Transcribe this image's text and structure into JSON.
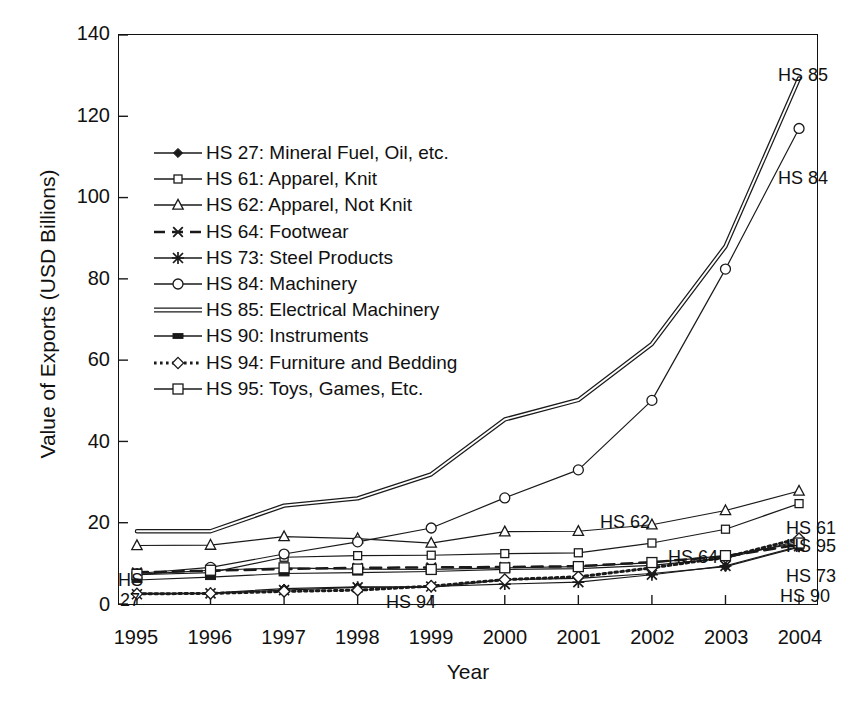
{
  "chart_data": {
    "type": "line",
    "title": "",
    "xlabel": "Year",
    "ylabel": "Value of Exports (USD Billions)",
    "x": [
      1995,
      1996,
      1997,
      1998,
      1999,
      2000,
      2001,
      2002,
      2003,
      2004
    ],
    "xticklabels": [
      "1995",
      "1996",
      "1997",
      "1998",
      "1999",
      "2000",
      "2001",
      "2002",
      "2003",
      "2004"
    ],
    "yticklabels": [
      "0",
      "20",
      "40",
      "60",
      "80",
      "100",
      "120",
      "140"
    ],
    "ylim": [
      0,
      140
    ],
    "ytick_step": 20,
    "grid": false,
    "legend_position": "upper-left-inside",
    "series": [
      {
        "name": "HS 27: Mineral Fuel, Oil, etc.",
        "code": "HS 27",
        "marker": "filled-diamond",
        "dash": "solid",
        "values": [
          2.6,
          2.7,
          3.8,
          4.2,
          4.1,
          6.0,
          6.3,
          7.5,
          9.2,
          14.0
        ]
      },
      {
        "name": "HS 61: Apparel, Knit",
        "code": "HS 61",
        "marker": "small-open-square",
        "dash": "solid",
        "values": [
          7.2,
          7.7,
          11.5,
          11.9,
          12.0,
          12.4,
          12.6,
          15.0,
          18.4,
          24.7
        ]
      },
      {
        "name": "HS 62: Apparel, Not Knit",
        "code": "HS 62",
        "marker": "open-triangle",
        "dash": "solid",
        "values": [
          14.4,
          14.5,
          16.6,
          16.1,
          15.0,
          17.8,
          17.9,
          19.5,
          23.0,
          27.8
        ]
      },
      {
        "name": "HS 64: Footwear",
        "code": "HS 64",
        "marker": "cross-x",
        "dash": "dashed",
        "values": [
          7.8,
          8.2,
          8.6,
          8.9,
          9.0,
          9.1,
          9.3,
          10.3,
          11.7,
          14.6
        ]
      },
      {
        "name": "HS 73: Steel Products",
        "code": "HS 73",
        "marker": "asterisk",
        "dash": "solid",
        "values": [
          2.4,
          2.6,
          3.4,
          4.1,
          4.3,
          4.9,
          5.4,
          7.2,
          9.4,
          14.2
        ]
      },
      {
        "name": "HS 84: Machinery",
        "code": "HS 84",
        "marker": "open-circle",
        "dash": "solid",
        "values": [
          7.5,
          9.0,
          12.3,
          15.3,
          18.7,
          26.1,
          33.0,
          50.1,
          82.4,
          117.0
        ]
      },
      {
        "name": "HS 85: Electrical Machinery",
        "code": "HS 85",
        "marker": "none",
        "dash": "double",
        "values": [
          17.9,
          17.9,
          24.2,
          26.0,
          31.9,
          45.4,
          50.2,
          64.0,
          88.0,
          129.3
        ]
      },
      {
        "name": "HS 90: Instruments",
        "code": "HS 90",
        "marker": "filled-rect",
        "dash": "solid",
        "values": [
          5.9,
          6.6,
          7.5,
          7.7,
          8.0,
          8.5,
          8.7,
          9.5,
          11.3,
          15.5
        ]
      },
      {
        "name": "HS 94: Furniture and Bedding",
        "code": "HS 94",
        "marker": "open-diamond",
        "dash": "dotted",
        "values": [
          2.5,
          2.6,
          3.1,
          3.4,
          4.4,
          6.0,
          6.7,
          8.9,
          11.5,
          16.1
        ]
      },
      {
        "name": "HS 95: Toys, Games, Etc.",
        "code": "HS 95",
        "marker": "open-square",
        "dash": "solid",
        "values": [
          7.3,
          8.3,
          8.9,
          8.6,
          8.5,
          8.9,
          9.2,
          10.2,
          11.9,
          15.0
        ]
      }
    ],
    "annotations": [
      {
        "code": "HS 85",
        "text": "HS 85",
        "x_px": 778,
        "y_px": 65
      },
      {
        "code": "HS 84",
        "text": "HS 84",
        "x_px": 778,
        "y_px": 168
      },
      {
        "code": "HS 62",
        "text": "HS 62",
        "x_px": 600,
        "y_px": 512
      },
      {
        "code": "HS 61",
        "text": "HS 61",
        "x_px": 786,
        "y_px": 518
      },
      {
        "code": "HS 95",
        "text": "HS 95",
        "x_px": 786,
        "y_px": 536
      },
      {
        "code": "HS 64",
        "text": "HS 64",
        "x_px": 668,
        "y_px": 547
      },
      {
        "code": "HS 73",
        "text": "HS 73",
        "x_px": 786,
        "y_px": 566
      },
      {
        "code": "HS 90",
        "text": "HS 90",
        "x_px": 780,
        "y_px": 586
      },
      {
        "code": "HS 27a",
        "text": "HS",
        "x_px": 118,
        "y_px": 570
      },
      {
        "code": "HS 27b",
        "text": "27",
        "x_px": 120,
        "y_px": 590
      },
      {
        "code": "HS 94",
        "text": "HS 94",
        "x_px": 386,
        "y_px": 592
      }
    ],
    "line_color": "#1a1a1a"
  }
}
